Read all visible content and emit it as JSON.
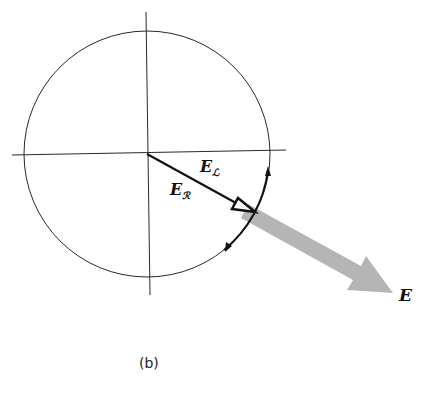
{
  "figure": {
    "caption": "(b)",
    "labels": {
      "e_l": {
        "main": "E",
        "sub": "ℒ"
      },
      "e_r": {
        "main": "E",
        "sub": "ℛ"
      },
      "e": {
        "main": "E"
      }
    },
    "colors": {
      "line": "#2a2a2a",
      "resultant_arrow": "#b5b5b5",
      "background": "#ffffff"
    },
    "geometry": {
      "circle": {
        "cx": 147,
        "cy": 154,
        "r": 123
      },
      "axes": {
        "h": [
          12,
          286
        ],
        "v": [
          12,
          295
        ]
      },
      "component_vector_tip": [
        252,
        211
      ],
      "resultant_tip": [
        393,
        293
      ]
    }
  }
}
